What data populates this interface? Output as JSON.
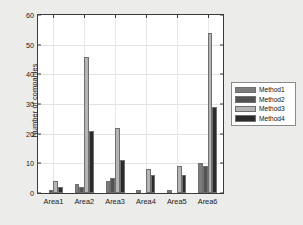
{
  "chart_data": {
    "type": "bar",
    "title": "",
    "xlabel": "",
    "ylabel": "Number of companies",
    "categories": [
      "Area1",
      "Area2",
      "Area3",
      "Area4",
      "Area5",
      "Area6"
    ],
    "series": [
      {
        "name": "Method1",
        "color": "#7d7d7d",
        "values": [
          0,
          3,
          4,
          1,
          1,
          10
        ]
      },
      {
        "name": "Method2",
        "color": "#535353",
        "values": [
          1,
          2,
          5,
          0,
          0,
          9
        ]
      },
      {
        "name": "Method3",
        "color": "#b5b5b5",
        "values": [
          4,
          46,
          22,
          8,
          9,
          54
        ]
      },
      {
        "name": "Method4",
        "color": "#2b2b2b",
        "values": [
          2,
          21,
          11,
          6,
          6,
          29
        ]
      }
    ],
    "ylim": [
      0,
      60
    ],
    "yticks": [
      0,
      10,
      20,
      30,
      40,
      50,
      60
    ],
    "ytick_labels": [
      "0",
      "10",
      "20",
      "30",
      "40",
      "50",
      "60"
    ],
    "grid": true,
    "legend_position": "right-outside",
    "legend_entries": [
      "Method1",
      "Method2",
      "Method3",
      "Method4"
    ],
    "background_color": "#ececeb",
    "plot_background_color": "#ffffff",
    "axis_color": "#3a3a3a"
  }
}
